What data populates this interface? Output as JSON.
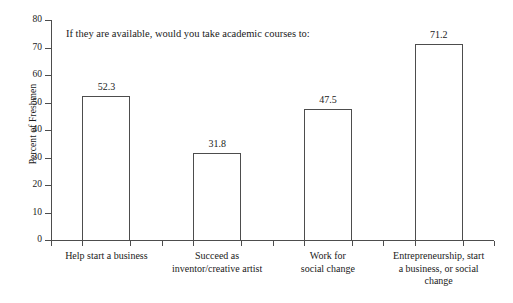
{
  "chart_data": {
    "type": "bar",
    "title": "If they are available, would you take academic courses to:",
    "xlabel": "",
    "ylabel": "Percent of Freshmen",
    "ylim": [
      0,
      80
    ],
    "ytick_values": [
      0,
      10,
      20,
      30,
      40,
      50,
      60,
      70,
      80
    ],
    "ytick_labels": [
      "0",
      "10",
      "20",
      "30",
      "40",
      "50",
      "60",
      "70",
      "80"
    ],
    "grid": false,
    "legend": "none",
    "categories": [
      "Help start a business",
      "Succeed as inventor/creative artist",
      "Work for social change",
      "Entrepreneurship, start a business, or social change"
    ],
    "category_lines": [
      [
        "Help start a business"
      ],
      [
        "Succeed as",
        "inventor/creative artist"
      ],
      [
        "Work for",
        "social change"
      ],
      [
        "Entrepreneurship, start",
        "a business, or social",
        "change"
      ]
    ],
    "values": [
      52.3,
      31.8,
      47.5,
      71.2
    ],
    "value_labels": [
      "52.3",
      "31.8",
      "47.5",
      "71.2"
    ],
    "colors": {
      "bar_fill": "#ffffff",
      "bar_stroke": "#4d4d4d",
      "axis": "#4d4d4d",
      "text": "#1a1a1a",
      "background": "#ffffff"
    }
  }
}
